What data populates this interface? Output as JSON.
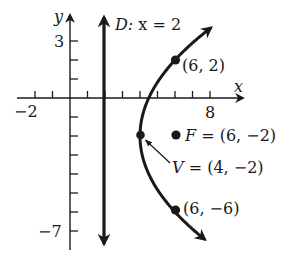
{
  "diagram": {
    "type": "parabola-graph",
    "equation_form": "(y + 2)^2 = 8(x - 4)",
    "axes": {
      "x_label": "x",
      "y_label": "y",
      "x_tick_labels": [
        {
          "value": -2,
          "text": "−2"
        },
        {
          "value": 8,
          "text": "8"
        }
      ],
      "y_tick_labels": [
        {
          "value": 3,
          "text": "3"
        },
        {
          "value": -7,
          "text": "−7"
        }
      ],
      "x_ticks": [
        -2,
        -1,
        1,
        2,
        3,
        4,
        5,
        6,
        7,
        8
      ],
      "y_ticks": [
        3,
        2,
        1,
        -1,
        -2,
        -3,
        -4,
        -5,
        -6,
        -7
      ],
      "x_range": [
        -2.5,
        9.2
      ],
      "y_range": [
        -7.9,
        4.5
      ]
    },
    "directrix": {
      "label_prefix": "D:",
      "label_eq": " x = 2",
      "x": 2
    },
    "points": [
      {
        "name": "point-6-2",
        "x": 6,
        "y": 2,
        "label": "(6, 2)"
      },
      {
        "name": "point-6-neg6",
        "x": 6,
        "y": -6,
        "label": "(6, −6)"
      }
    ],
    "focus": {
      "x": 6,
      "y": -2,
      "label_name": "F",
      "label_eq": " = (6, −2)"
    },
    "vertex": {
      "x": 4,
      "y": -2,
      "label_name": "V",
      "label_eq": " = (4, −2)"
    },
    "colors": {
      "ink": "#1a1a1a",
      "background": "#ffffff"
    }
  }
}
